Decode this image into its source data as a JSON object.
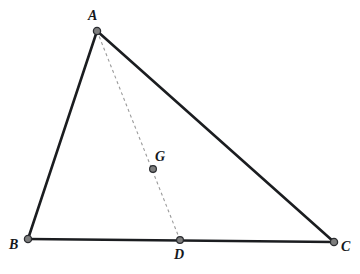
{
  "figure": {
    "background_color": "#ffffff",
    "width": 360,
    "height": 274
  },
  "style": {
    "solid_edge_color": "#1b1d20",
    "solid_edge_width": 2.6,
    "dashed_line_color": "#9a9a9a",
    "dashed_line_width": 1.1,
    "dash_pattern": "3,3",
    "point_fill_color": "#7d7d7d",
    "point_stroke_color": "#2a2c30",
    "point_radius": 3.6,
    "label_color": "#15181c"
  },
  "points": [
    {
      "id": "A",
      "label": "A",
      "x": 97,
      "y": 31,
      "role": "vertex",
      "label_x": 88,
      "label_y": 9
    },
    {
      "id": "B",
      "label": "B",
      "x": 28,
      "y": 239,
      "role": "vertex",
      "label_x": 9,
      "label_y": 238
    },
    {
      "id": "C",
      "label": "C",
      "x": 334,
      "y": 242,
      "role": "vertex",
      "label_x": 341,
      "label_y": 240
    },
    {
      "id": "D",
      "label": "D",
      "x": 180,
      "y": 240,
      "role": "midpoint",
      "label_x": 174,
      "label_y": 248
    },
    {
      "id": "G",
      "label": "G",
      "x": 153,
      "y": 169,
      "role": "centroid",
      "label_x": 155,
      "label_y": 150
    }
  ],
  "segments": [
    {
      "id": "AB",
      "from": "A",
      "to": "B",
      "style": "solid",
      "name": "side-ab"
    },
    {
      "id": "AC",
      "from": "A",
      "to": "C",
      "style": "solid",
      "name": "side-ac"
    },
    {
      "id": "BC",
      "from": "B",
      "to": "C",
      "style": "solid",
      "name": "side-bc"
    },
    {
      "id": "AD",
      "from": "A",
      "to": "D",
      "style": "dashed",
      "name": "median-ad"
    }
  ]
}
